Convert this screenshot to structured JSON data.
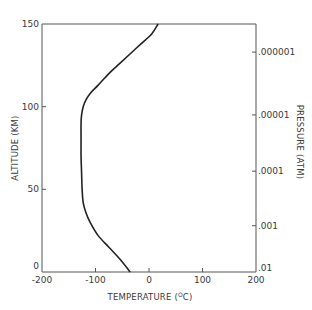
{
  "chart_data": {
    "type": "line",
    "title": "",
    "xlabel": "TEMPERATURE (°C)",
    "ylabel": "ALTITUDE (KM)",
    "y2label": "PRESSURE (ATM)",
    "xlim": [
      -200,
      200
    ],
    "ylim": [
      0,
      150
    ],
    "grid": false,
    "legend": null,
    "x_ticks": [
      -200,
      -100,
      0,
      100,
      200
    ],
    "x_tick_labels": [
      "-200",
      "-100",
      "0",
      "100",
      "200"
    ],
    "y_ticks": [
      0,
      50,
      100,
      150
    ],
    "y_tick_labels": [
      "0",
      "50",
      "100",
      "150"
    ],
    "y2_ticks": [
      {
        "label": ".01",
        "altitude_km": 0
      },
      {
        "label": ".001",
        "altitude_km": 28
      },
      {
        "label": ".0001",
        "altitude_km": 61
      },
      {
        "label": ".00001",
        "altitude_km": 95
      },
      {
        "label": ".000001",
        "altitude_km": 133
      }
    ],
    "series": [
      {
        "name": "Temperature profile",
        "x": [
          -35,
          -55,
          -75,
          -95,
          -110,
          -118,
          -123,
          -125,
          -126,
          -127,
          -127,
          -127,
          -126,
          -123,
          -118,
          -110,
          -95,
          -75,
          -55,
          -35,
          -15,
          5,
          17
        ],
        "y": [
          0,
          8,
          15,
          22,
          30,
          36,
          42,
          50,
          60,
          70,
          80,
          90,
          95,
          100,
          104,
          108,
          113,
          120,
          126,
          132,
          138,
          144,
          150
        ]
      }
    ]
  },
  "labels": {
    "xlabel_main": "TEMPERATURE (",
    "xlabel_sup": "O",
    "xlabel_end": "C)",
    "ylabel": "ALTITUDE (KM)",
    "y2label": "PRESSURE (ATM)"
  }
}
